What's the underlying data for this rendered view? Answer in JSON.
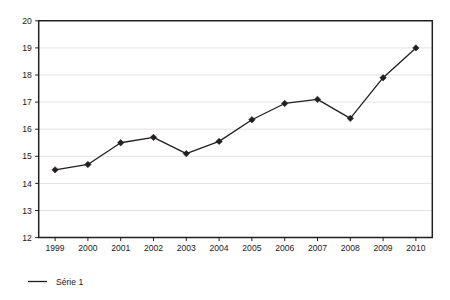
{
  "chart_data": {
    "type": "line",
    "title": "",
    "subtitle": "",
    "xlabel": "",
    "ylabel": "",
    "categories": [
      "1999",
      "2000",
      "2001",
      "2002",
      "2003",
      "2004",
      "2005",
      "2006",
      "2007",
      "2008",
      "2009",
      "2010"
    ],
    "series": [
      {
        "name": "Série 1",
        "values": [
          14.5,
          14.7,
          15.5,
          15.7,
          15.1,
          15.55,
          16.35,
          16.95,
          17.1,
          16.4,
          17.9,
          19.0
        ],
        "color": "#231f20",
        "marker": "diamond",
        "line_width": 1.3
      }
    ],
    "ylim": [
      12,
      20
    ],
    "yticks": [
      12,
      13,
      14,
      15,
      16,
      17,
      18,
      19,
      20
    ],
    "ytick_labels": [
      "12",
      "13",
      "14",
      "15",
      "16",
      "17",
      "18",
      "19",
      "20"
    ],
    "xtick_labels": [
      "1999",
      "2000",
      "2001",
      "2002",
      "2003",
      "2004",
      "2005",
      "2006",
      "2007",
      "2008",
      "2009",
      "2010"
    ],
    "grid": {
      "horizontal": true,
      "vertical": false,
      "color": "#e3e3e3"
    },
    "legend": {
      "position": "bottom-left",
      "entries": [
        {
          "label": "Série 1",
          "marker": "line",
          "color": "#231f20"
        }
      ]
    },
    "axis": {
      "color": "#231f20",
      "plot_background": "#ffffff",
      "figure_background": "#ffffff"
    }
  }
}
